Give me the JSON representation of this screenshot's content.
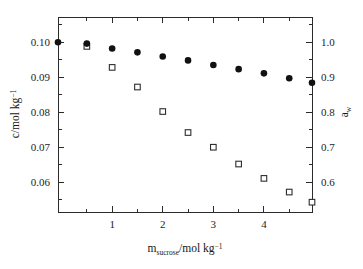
{
  "chart_data": {
    "type": "scatter",
    "title": "",
    "subtitle": "",
    "xlabel": "m_sucrose/mol kg^-1",
    "xlabel_parts": {
      "base": "m",
      "subscript": "sucrose",
      "rest": "/mol kg",
      "superscript": "−1"
    },
    "ylabel_left": "c/mol kg^-1",
    "ylabel_left_parts": {
      "base": "c/mol kg",
      "superscript": "−1"
    },
    "ylabel_right": "a_w",
    "ylabel_right_parts": {
      "base": "a",
      "subscript": "w"
    },
    "xlim": [
      -0.07,
      4.95
    ],
    "ylim_left": [
      0.0515,
      0.1072
    ],
    "ylim_right": [
      0.515,
      1.072
    ],
    "xticks": [
      1,
      2,
      3,
      4
    ],
    "xticklabels": [
      "1",
      "2",
      "3",
      "4"
    ],
    "xminorticks": [
      0.5,
      1.5,
      2.5,
      3.5,
      4.5
    ],
    "yticks_left": [
      0.06,
      0.07,
      0.08,
      0.09,
      0.1
    ],
    "yticklabels_left": [
      "0.06",
      "0.07",
      "0.08",
      "0.09",
      "0.10"
    ],
    "yminorticks_left": [
      0.055,
      0.065,
      0.075,
      0.085,
      0.095,
      0.105
    ],
    "yticks_right": [
      0.6,
      0.7,
      0.8,
      0.9,
      1.0
    ],
    "yticklabels_right": [
      "0.6",
      "0.7",
      "0.8",
      "0.9",
      "1.0"
    ],
    "yminorticks_right": [
      0.55,
      0.65,
      0.75,
      0.85,
      0.95,
      1.05
    ],
    "grid": false,
    "legend": null,
    "legend_position": "none",
    "marker_color_filled": "#111111",
    "marker_color_open": "#2e2e2e",
    "axis_color": "#2b2b2b",
    "background": "#ffffff",
    "series": [
      {
        "name": "c",
        "marker": "filled-circle",
        "axis": "left",
        "x": [
          -0.07,
          0.5,
          1.0,
          1.5,
          2.0,
          2.5,
          3.0,
          3.5,
          4.0,
          4.5,
          4.95
        ],
        "y": [
          0.1,
          0.0996,
          0.0982,
          0.0971,
          0.0959,
          0.0948,
          0.0935,
          0.0923,
          0.0911,
          0.0897,
          0.0884
        ]
      },
      {
        "name": "a_w",
        "marker": "open-square",
        "axis": "right",
        "x": [
          0.5,
          1.0,
          1.5,
          2.0,
          2.5,
          3.0,
          3.5,
          4.0,
          4.5,
          4.95
        ],
        "y": [
          0.988,
          0.928,
          0.872,
          0.802,
          0.742,
          0.7,
          0.652,
          0.611,
          0.572,
          0.543
        ]
      }
    ]
  }
}
